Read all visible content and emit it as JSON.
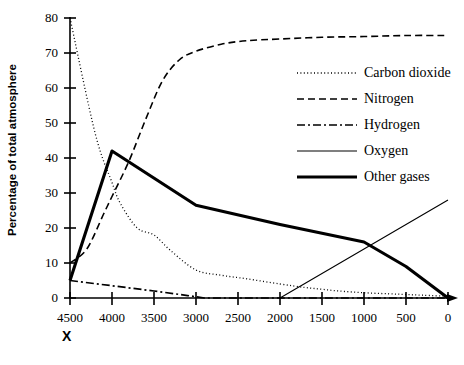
{
  "chart_data": {
    "type": "line",
    "title": "",
    "xlabel": "X",
    "ylabel": "Percentage of total atmosphere",
    "xticks": [
      "4500",
      "4000",
      "3500",
      "3000",
      "2500",
      "2000",
      "1500",
      "1000",
      "500",
      "0"
    ],
    "yticks": [
      "0",
      "10",
      "20",
      "30",
      "40",
      "50",
      "60",
      "70",
      "80"
    ],
    "xlim": [
      4500,
      0
    ],
    "ylim": [
      0,
      80
    ],
    "x_reversed": true,
    "grid": false,
    "legend_position": "center-right",
    "series": [
      {
        "name": "Carbon dioxide",
        "style": "dotted",
        "color": "#000000",
        "x": [
          4500,
          4200,
          4000,
          3900,
          3700,
          3500,
          3300,
          3000,
          2700,
          2400,
          2000,
          1700,
          1500,
          1300,
          1000,
          700,
          500,
          300,
          0
        ],
        "values": [
          80,
          47,
          33,
          27,
          20,
          18,
          13.5,
          8,
          6.5,
          5.5,
          4,
          3,
          2.5,
          2,
          1.5,
          1.2,
          1,
          0.8,
          0.5
        ]
      },
      {
        "name": "Nitrogen",
        "style": "dashed",
        "color": "#000000",
        "x": [
          4500,
          4300,
          4100,
          4000,
          3800,
          3600,
          3400,
          3200,
          3000,
          2700,
          2400,
          2000,
          1500,
          1000,
          500,
          0
        ],
        "values": [
          10,
          14,
          24,
          29,
          39,
          51,
          62,
          68,
          70.5,
          72.5,
          73.5,
          74,
          74.5,
          74.7,
          75,
          75
        ]
      },
      {
        "name": "Hydrogen",
        "style": "dashdot",
        "color": "#000000",
        "x": [
          4500,
          4000,
          3500,
          3100,
          2900,
          2000,
          0
        ],
        "values": [
          5,
          3.5,
          2,
          0.7,
          0,
          0,
          0
        ]
      },
      {
        "name": "Oxygen",
        "style": "thin-solid",
        "color": "#000000",
        "x": [
          2000,
          1500,
          1000,
          500,
          0
        ],
        "values": [
          0,
          7,
          14,
          21,
          28
        ]
      },
      {
        "name": "Other gases",
        "style": "thick-solid",
        "color": "#000000",
        "x": [
          4500,
          4000,
          3000,
          2000,
          1000,
          500,
          0
        ],
        "values": [
          5,
          42,
          26.5,
          21,
          16,
          9,
          0
        ]
      }
    ]
  }
}
